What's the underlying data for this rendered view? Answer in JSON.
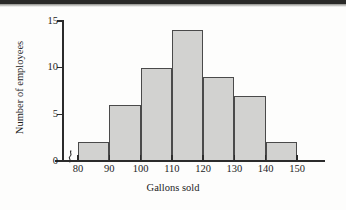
{
  "chart_data": {
    "type": "bar",
    "title": "",
    "subtitle": "",
    "xlabel": "Gallons sold",
    "ylabel": "Number of employees",
    "categories": [
      "80-90",
      "90-100",
      "100-110",
      "110-120",
      "120-130",
      "130-140",
      "140-150"
    ],
    "bin_edges": [
      80,
      90,
      100,
      110,
      120,
      130,
      140,
      150
    ],
    "values": [
      2,
      6,
      10,
      14,
      9,
      7,
      2
    ],
    "xtick_labels": [
      "80",
      "90",
      "100",
      "110",
      "120",
      "130",
      "140",
      "150"
    ],
    "ytick_labels": [
      "0",
      "5",
      "10",
      "15"
    ],
    "ytick_values": [
      0,
      5,
      10,
      15
    ],
    "ylim": [
      0,
      15
    ],
    "xlim": [
      80,
      150
    ],
    "grid": false,
    "legend": false,
    "axis_break": true,
    "bar_fill_color": "#d2d2d0",
    "bar_edge_color": "#4a4a4a",
    "axis_color": "#2b2b2b",
    "background_color": "#fdfdfc"
  }
}
